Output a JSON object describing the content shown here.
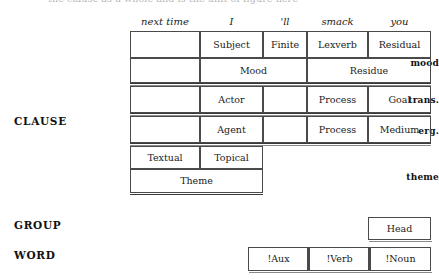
{
  "clipped_top_line": "the clause as a whole and is the unit of figure here",
  "strata": {
    "clause": "CLAUSE",
    "group": "GROUP",
    "word": "WORD"
  },
  "metafunction_rows": {
    "mood": "mood",
    "transitivity": "trans.",
    "ergativity": "erg.",
    "theme": "theme"
  },
  "columns": [
    {
      "text": "next time",
      "x": 0,
      "w": 70
    },
    {
      "text": "I",
      "x": 70,
      "w": 63
    },
    {
      "text": "'ll",
      "x": 133,
      "w": 44
    },
    {
      "text": "smack",
      "x": 177,
      "w": 61
    },
    {
      "text": "you",
      "x": 238,
      "w": 63
    }
  ],
  "analysis": {
    "mood_functions": [
      "",
      "Subject",
      "Finite",
      "Lexverb",
      "Residual"
    ],
    "mood_spans": [
      "Mood",
      "Residue"
    ],
    "transitivity": [
      "",
      "Actor",
      "",
      "Process",
      "Goal"
    ],
    "ergativity": [
      "",
      "Agent",
      "",
      "Process",
      "Medium"
    ],
    "theme_functions": [
      "Textual",
      "Topical"
    ],
    "theme_span": "Theme",
    "group_rank": "Head",
    "word_rank": [
      "!Aux",
      "!Verb",
      "!Noun"
    ]
  }
}
